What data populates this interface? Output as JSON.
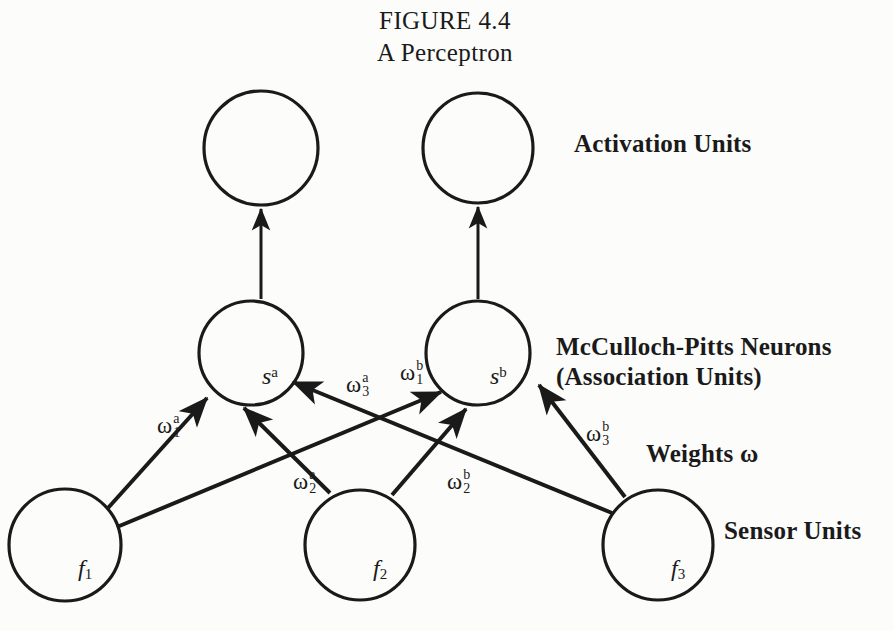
{
  "figure": {
    "caption_title": "FIGURE 4.4",
    "caption_subtitle": "A Perceptron",
    "background_color": "#fcfcfb",
    "ink_color": "#1a1a1a"
  },
  "labels": {
    "activation_units": "Activation Units",
    "mcp_line1": "McCulloch-Pitts Neurons",
    "mcp_line2": "(Association Units)",
    "weights": "Weights ω",
    "sensor_units": "Sensor Units"
  },
  "nodes": {
    "activation": [
      {
        "id": "act-a",
        "label": "",
        "cx": 261,
        "cy": 148,
        "r": 57
      },
      {
        "id": "act-b",
        "label": "",
        "cx": 478,
        "cy": 148,
        "r": 55
      }
    ],
    "association": [
      {
        "id": "s-a",
        "base": "s",
        "sup": "a",
        "cx": 251,
        "cy": 353,
        "r": 52
      },
      {
        "id": "s-b",
        "base": "s",
        "sup": "b",
        "cx": 478,
        "cy": 353,
        "r": 52
      }
    ],
    "sensor": [
      {
        "id": "f-1",
        "base": "f",
        "sub": "1",
        "cx": 65,
        "cy": 545,
        "r": 56
      },
      {
        "id": "f-2",
        "base": "f",
        "sub": "2",
        "cx": 360,
        "cy": 545,
        "r": 55
      },
      {
        "id": "f-3",
        "base": "f",
        "sub": "3",
        "cx": 658,
        "cy": 545,
        "r": 55
      }
    ]
  },
  "weights": [
    {
      "id": "w1a",
      "symbol": "ω",
      "sup": "a",
      "sub": "1",
      "from": "f-1",
      "to": "s-a"
    },
    {
      "id": "w2a",
      "symbol": "ω",
      "sup": "a",
      "sub": "2",
      "from": "f-2",
      "to": "s-a"
    },
    {
      "id": "w3a",
      "symbol": "ω",
      "sup": "a",
      "sub": "3",
      "from": "f-3",
      "to": "s-a"
    },
    {
      "id": "w1b",
      "symbol": "ω",
      "sup": "b",
      "sub": "1",
      "from": "f-1",
      "to": "s-b"
    },
    {
      "id": "w2b",
      "symbol": "ω",
      "sup": "b",
      "sub": "2",
      "from": "f-2",
      "to": "s-b"
    },
    {
      "id": "w3b",
      "symbol": "ω",
      "sup": "b",
      "sub": "3",
      "from": "f-3",
      "to": "s-b"
    }
  ],
  "connections": {
    "activation_arrows": [
      {
        "id": "arrow-sa-acta",
        "from": "s-a",
        "to": "act-a"
      },
      {
        "id": "arrow-sb-actb",
        "from": "s-b",
        "to": "act-b"
      }
    ]
  }
}
